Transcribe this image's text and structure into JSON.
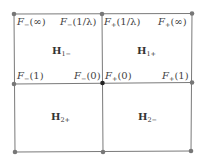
{
  "diagram": {
    "colors": {
      "line": "#7a7a7a",
      "dot": "#777777",
      "center_dot": "#222222",
      "text": "#444444"
    },
    "vertex_labels": {
      "tl_top": {
        "f": "F",
        "sub": "−",
        "arg": "(∞)"
      },
      "tm_left": {
        "f": "F",
        "sub": "−",
        "arg": "(1/λ)"
      },
      "tm_right": {
        "f": "F",
        "sub": "+",
        "arg": "(1/λ)"
      },
      "tr_top": {
        "f": "F",
        "sub": "+",
        "arg": "(∞)"
      },
      "ml": {
        "f": "F",
        "sub": "−",
        "arg": "(1)"
      },
      "mc_left": {
        "f": "F",
        "sub": "−",
        "arg": "(0)"
      },
      "mc_right": {
        "f": "F",
        "sub": "+",
        "arg": "(0)"
      },
      "mr": {
        "f": "F",
        "sub": "+",
        "arg": "(1)"
      }
    },
    "regions": {
      "top_left": {
        "H": "H",
        "sub": "1−"
      },
      "top_right": {
        "H": "H",
        "sub": "1+"
      },
      "bottom_left": {
        "H": "H",
        "sub": "2+"
      },
      "bottom_right": {
        "H": "H",
        "sub": "2−"
      }
    }
  }
}
